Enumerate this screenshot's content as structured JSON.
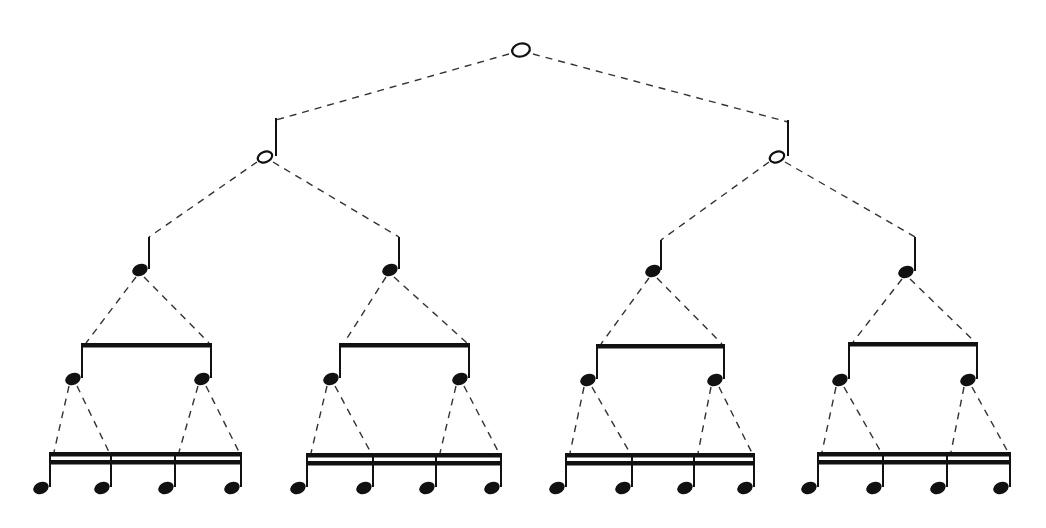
{
  "diagram": {
    "colors": {
      "ink": "#111111",
      "dash": "#333333",
      "background": "#ffffff"
    },
    "levels": [
      {
        "name": "whole",
        "count": 1
      },
      {
        "name": "half",
        "count": 2
      },
      {
        "name": "quarter",
        "count": 4
      },
      {
        "name": "eighth",
        "count": 8
      },
      {
        "name": "sixteenth",
        "count": 16
      }
    ],
    "whole": {
      "x": 521,
      "y": 50
    },
    "halves": [
      {
        "x": 265,
        "y": 157,
        "stem_x": 276,
        "stem_top": 118
      },
      {
        "x": 777,
        "y": 157,
        "stem_x": 788,
        "stem_top": 120
      }
    ],
    "quarters": [
      {
        "x": 140,
        "y": 270,
        "stem_x": 149,
        "stem_top": 237,
        "parent": 0
      },
      {
        "x": 390,
        "y": 270,
        "stem_x": 399,
        "stem_top": 237,
        "parent": 0
      },
      {
        "x": 653,
        "y": 271,
        "stem_x": 661,
        "stem_top": 240,
        "parent": 1
      },
      {
        "x": 906,
        "y": 272,
        "stem_x": 915,
        "stem_top": 237,
        "parent": 1
      }
    ],
    "eighth_groups": [
      {
        "beam_y": 345,
        "stems": [
          82,
          211
        ],
        "head_y": 379
      },
      {
        "beam_y": 345,
        "stems": [
          340,
          469
        ],
        "head_y": 379
      },
      {
        "beam_y": 346,
        "stems": [
          597,
          724
        ],
        "head_y": 380
      },
      {
        "beam_y": 344,
        "stems": [
          849,
          977
        ],
        "head_y": 380
      }
    ],
    "sixteenth_groups": [
      {
        "beam_y": 455,
        "stems": [
          50,
          111,
          175,
          241
        ],
        "head_y": 488
      },
      {
        "beam_y": 456,
        "stems": [
          307,
          373,
          436,
          501
        ],
        "head_y": 488
      },
      {
        "beam_y": 456,
        "stems": [
          566,
          632,
          694,
          754
        ],
        "head_y": 488
      },
      {
        "beam_y": 455,
        "stems": [
          818,
          883,
          947,
          1010
        ],
        "head_y": 488
      }
    ]
  }
}
